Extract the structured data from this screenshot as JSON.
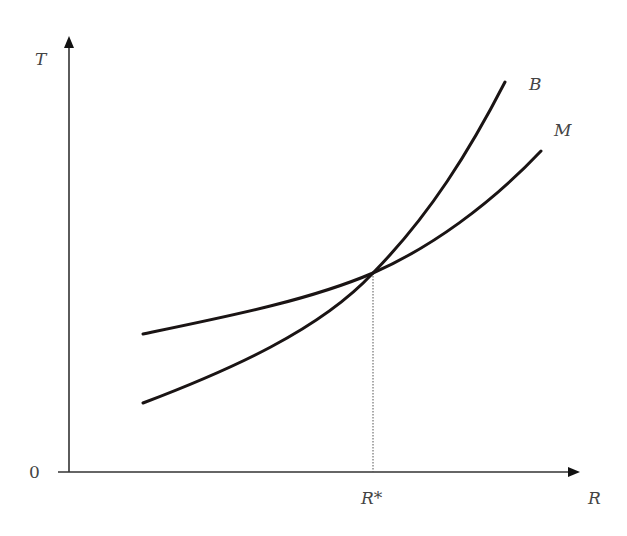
{
  "diagram": {
    "y_axis_label": "T",
    "x_axis_label": "R",
    "origin_label": "0",
    "equilibrium_label": "R*",
    "curves": [
      {
        "name": "B",
        "label": "B",
        "description": "steeper convex curve, starts lower"
      },
      {
        "name": "M",
        "label": "M",
        "description": "flatter convex curve, starts higher"
      }
    ],
    "intersection": {
      "x_label": "R*",
      "line_style": "dotted"
    }
  },
  "colors": {
    "curve": "#1a1414",
    "axis": "#333333",
    "text": "#444444"
  }
}
